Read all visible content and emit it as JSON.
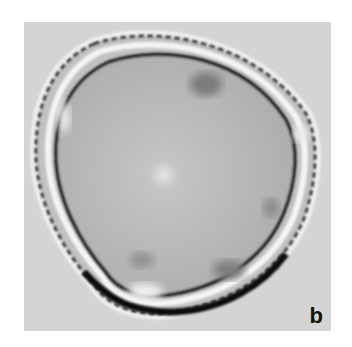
{
  "figure": {
    "panel_label": "b",
    "colors": {
      "page_background": "#ffffff",
      "panel_background": "#d4d4d4",
      "grain_interior": "#b9b9b9",
      "wall_dark": "#1e1e1e",
      "wall_halo": "#f2f2f2"
    }
  }
}
